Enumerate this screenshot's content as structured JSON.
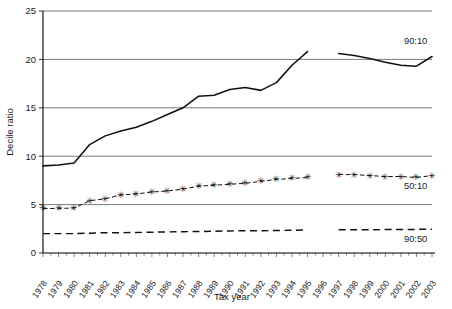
{
  "chart_data": {
    "type": "line",
    "title": "",
    "xlabel": "Tax year",
    "ylabel": "Decile ratio",
    "xlim": [
      1978,
      2003
    ],
    "ylim": [
      0,
      25
    ],
    "yticks": [
      0,
      5,
      10,
      15,
      20,
      25
    ],
    "grid": "horizontal",
    "legend_position": "inline-right",
    "x": [
      1978,
      1979,
      1980,
      1981,
      1982,
      1983,
      1984,
      1985,
      1986,
      1987,
      1988,
      1989,
      1990,
      1991,
      1992,
      1993,
      1994,
      1995,
      1996,
      1997,
      1998,
      1999,
      2000,
      2001,
      2002,
      2003
    ],
    "categories": [
      "1978",
      "1979",
      "1980",
      "1981",
      "1982",
      "1983",
      "1984",
      "1985",
      "1986",
      "1987",
      "1988",
      "1989",
      "1990",
      "1991",
      "1992",
      "1993",
      "1994",
      "1995",
      "1996",
      "1997",
      "1998",
      "1999",
      "2000",
      "2001",
      "2002",
      "2003"
    ],
    "series": [
      {
        "name": "90:10",
        "style": "solid",
        "label": "90:10",
        "values": [
          9.0,
          9.1,
          9.3,
          11.2,
          12.1,
          12.6,
          13.0,
          13.6,
          14.3,
          15.0,
          16.2,
          16.3,
          16.9,
          17.1,
          16.8,
          17.6,
          19.4,
          20.8,
          null,
          20.6,
          20.4,
          20.1,
          19.7,
          19.4,
          19.3,
          20.3
        ]
      },
      {
        "name": "50:10",
        "style": "dash-dot-with-markers",
        "label": "50:10",
        "values": [
          4.6,
          4.6,
          4.65,
          5.4,
          5.6,
          6.0,
          6.1,
          6.3,
          6.4,
          6.6,
          6.9,
          7.0,
          7.1,
          7.2,
          7.4,
          7.6,
          7.7,
          7.8,
          null,
          8.1,
          8.1,
          8.0,
          7.9,
          7.9,
          7.8,
          8.0
        ]
      },
      {
        "name": "90:50",
        "style": "dashed",
        "label": "90:50",
        "values": [
          2.0,
          2.0,
          2.0,
          2.05,
          2.1,
          2.1,
          2.12,
          2.15,
          2.18,
          2.2,
          2.22,
          2.25,
          2.28,
          2.3,
          2.3,
          2.32,
          2.35,
          2.38,
          null,
          2.4,
          2.4,
          2.4,
          2.42,
          2.42,
          2.44,
          2.46
        ]
      }
    ]
  }
}
